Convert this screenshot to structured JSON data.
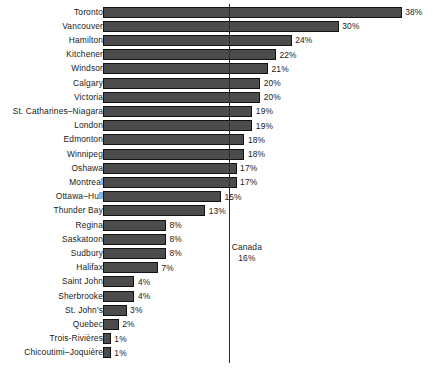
{
  "chart_data": {
    "type": "bar",
    "orientation": "horizontal",
    "title": "",
    "subtitle": "",
    "xlabel": "",
    "ylabel": "",
    "grid": false,
    "legend": null,
    "xlim": [
      0,
      38
    ],
    "value_suffix": "%",
    "categories": [
      "Toronto",
      "Vancouver",
      "Hamilton",
      "Kitchener",
      "Windsor",
      "Calgary",
      "Victoria",
      "St. Catharines–Niagara",
      "London",
      "Edmonton",
      "Winnipeg",
      "Oshawa",
      "Montreal",
      "Ottawa–Hull",
      "Thunder Bay",
      "Regina",
      "Saskatoon",
      "Sudbury",
      "Halifax",
      "Saint John",
      "Sherbrooke",
      "St. John's",
      "Quebec",
      "Trois-Rivières",
      "Chicoutimi–Joquière"
    ],
    "values": [
      38,
      30,
      24,
      22,
      21,
      20,
      20,
      19,
      19,
      18,
      18,
      17,
      17,
      15,
      13,
      8,
      8,
      8,
      7,
      4,
      4,
      3,
      2,
      1,
      1
    ],
    "data_labels": [
      "38%",
      "30%",
      "24%",
      "22%",
      "21%",
      "20%",
      "20%",
      "19%",
      "19%",
      "18%",
      "18%",
      "17%",
      "17%",
      "15%",
      "13%",
      "8%",
      "8%",
      "8%",
      "7%",
      "4%",
      "4%",
      "3%",
      "2%",
      "1%",
      "1%"
    ],
    "annotations": [
      {
        "kind": "reference-line",
        "name": "Canada",
        "value": 16,
        "value_label": "16%",
        "label_lines": [
          "Canada",
          "16%"
        ]
      }
    ],
    "colors": {
      "bar_fill": "#4c4c4c",
      "bar_stroke": "#131313",
      "reference_line": "#2b2b2b",
      "text": "#1a1a1a",
      "background": "#ffffff"
    }
  }
}
